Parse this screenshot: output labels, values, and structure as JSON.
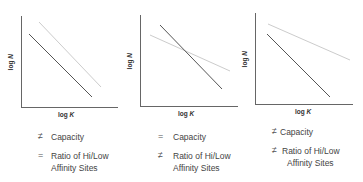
{
  "panels": [
    {
      "x_label": "log K",
      "y_label": "log N",
      "legend": [
        {
          "symbol": "≠",
          "text": "Capacity"
        },
        {
          "symbol": "=",
          "text": "Ratio of Hi/Low",
          "text2": "Affinity Sites"
        }
      ],
      "lines": [
        {
          "name": "dark",
          "color": "#555555",
          "x1": 29,
          "y1": 34,
          "x2": 92,
          "y2": 97
        },
        {
          "name": "light",
          "color": "#cccccc",
          "x1": 39,
          "y1": 22,
          "x2": 101,
          "y2": 87
        }
      ]
    },
    {
      "x_label": "log K",
      "y_label": "log N",
      "legend": [
        {
          "symbol": "=",
          "text": "Capacity"
        },
        {
          "symbol": "≠",
          "text": "Ratio of Hi/Low",
          "text2": "Affinity Sites"
        }
      ],
      "lines": [
        {
          "name": "dark",
          "color": "#555555",
          "x1": 160,
          "y1": 25,
          "x2": 222,
          "y2": 89
        },
        {
          "name": "light",
          "color": "#cccccc",
          "x1": 150,
          "y1": 35,
          "x2": 230,
          "y2": 71
        }
      ]
    },
    {
      "x_label": "log K",
      "y_label": "log N",
      "legend": [
        {
          "symbol": "≠",
          "text": "Capacity"
        },
        {
          "symbol": "≠",
          "text": "Ratio of Hi/Low",
          "text2": "Affinity Sites"
        }
      ],
      "lines": [
        {
          "name": "dark",
          "color": "#555555",
          "x1": 267,
          "y1": 34,
          "x2": 330,
          "y2": 97
        },
        {
          "name": "light",
          "color": "#cccccc",
          "x1": 268,
          "y1": 24,
          "x2": 350,
          "y2": 60
        }
      ]
    }
  ],
  "colors": {
    "axis": "#666666",
    "dark_line": "#555555",
    "light_line": "#cccccc"
  }
}
